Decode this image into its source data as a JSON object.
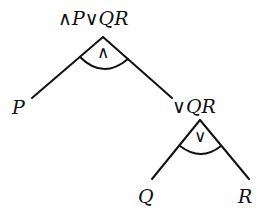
{
  "diagram": {
    "type": "expression-tree",
    "root": {
      "label": "∧ P∨ Q R",
      "operator": "∧",
      "children": [
        "P",
        "∨ Q R"
      ]
    },
    "nodes": {
      "root_label": "∧P∨QR",
      "left_leaf": "P",
      "right_sub_label": "∨QR",
      "sub_left_leaf": "Q",
      "sub_right_leaf": "R",
      "root_operator": "∧",
      "sub_operator": "∨"
    },
    "colors": {
      "line": "#111111",
      "background": "#ffffff"
    }
  }
}
